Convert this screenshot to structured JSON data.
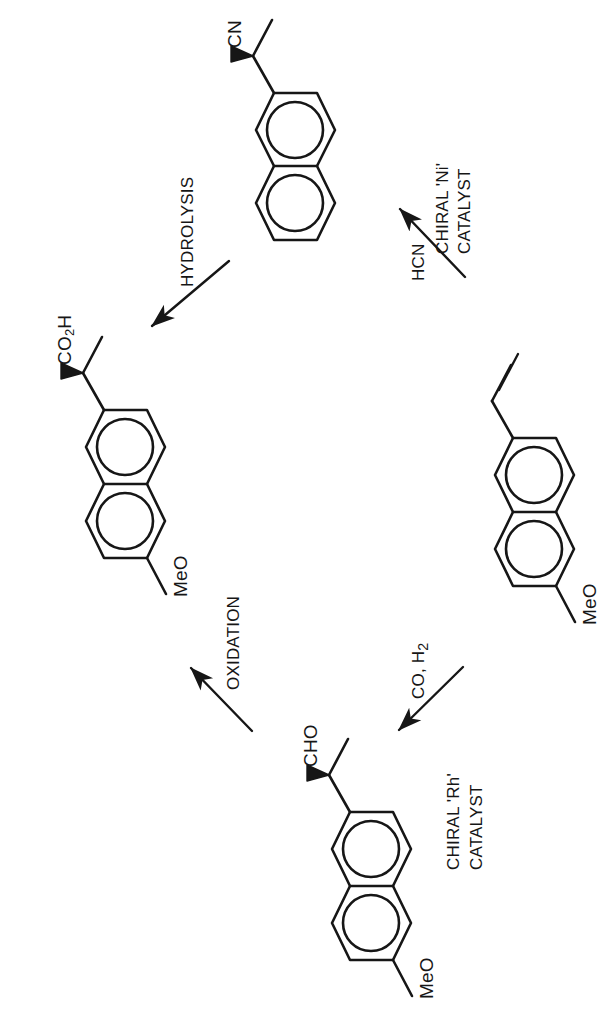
{
  "scheme": {
    "title": "Naproxen synthesis reaction scheme",
    "width": 606,
    "height": 1032,
    "stroke_color": "#161616",
    "background_color": "#ffffff"
  },
  "molecules": [
    {
      "id": "nitrile",
      "name": "2-(naphthalen-2-yl)propanenitrile",
      "labels": [
        {
          "key": "cn",
          "text": "CN"
        }
      ]
    },
    {
      "id": "naproxen",
      "name": "naproxen",
      "labels": [
        {
          "key": "co2h",
          "text": "CO",
          "sub": "2",
          "tail": "H"
        },
        {
          "key": "meo",
          "text": "MeO"
        }
      ]
    },
    {
      "id": "aldehyde",
      "name": "2-(6-methoxynaphthalen-2-yl)propanal",
      "labels": [
        {
          "key": "cho",
          "text": "CHO"
        },
        {
          "key": "meo",
          "text": "MeO"
        }
      ]
    },
    {
      "id": "vinyl",
      "name": "2-methoxy-6-vinylnaphthalene",
      "labels": [
        {
          "key": "meo",
          "text": "MeO"
        }
      ]
    }
  ],
  "atom_labels": {
    "cn": "CN",
    "co2h_main": "CO",
    "co2h_sub": "2",
    "co2h_tail": "H",
    "cho": "CHO",
    "meo_naproxen": "MeO",
    "meo_vinyl": "MeO",
    "meo_aldehyde": "MeO"
  },
  "arrows": [
    {
      "id": "hydrolysis",
      "label": "HYDROLYSIS",
      "direction": "down-left"
    },
    {
      "id": "hcn-addition",
      "label_reagent": "HCN",
      "label_catalyst_line1": "CHIRAL 'Ni'",
      "label_catalyst_line2": "CATALYST",
      "direction": "up-left"
    },
    {
      "id": "hydroformylation",
      "label_reagent": "CO, H",
      "label_reagent_sub": "2",
      "label_catalyst_line1": "CHIRAL 'Rh'",
      "label_catalyst_line2": "CATALYST",
      "direction": "down-left"
    },
    {
      "id": "oxidation",
      "label": "OXIDATION",
      "direction": "up-left"
    }
  ],
  "condition_labels": {
    "hydrolysis": "HYDROLYSIS",
    "hcn": "HCN",
    "chiral_ni": "CHIRAL 'Ni'",
    "catalyst_ni": "CATALYST",
    "co_h2_main": "CO, H",
    "co_h2_sub": "2",
    "chiral_rh": "CHIRAL 'Rh'",
    "catalyst_rh": "CATALYST",
    "oxidation": "OXIDATION"
  }
}
